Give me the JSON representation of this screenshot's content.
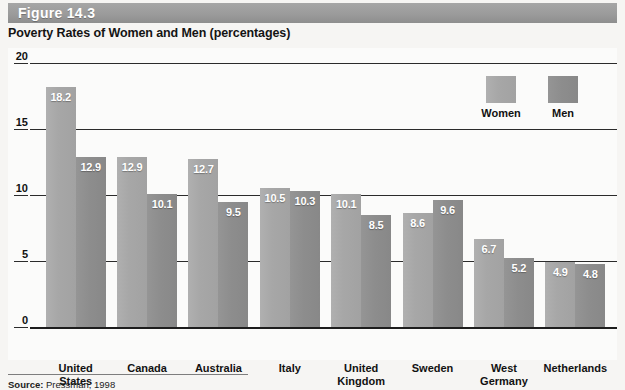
{
  "figure": {
    "label": "Figure 14.3",
    "subtitle": "Poverty Rates of Women and Men (percentages)"
  },
  "source": {
    "prefix": "Source:",
    "text": " Pressman, 1998"
  },
  "legend": {
    "items": [
      {
        "label": "Women",
        "color": "#a7a7a7"
      },
      {
        "label": "Men",
        "color": "#8d8d8d"
      }
    ]
  },
  "colors": {
    "header_band": "#9b9b9b",
    "women_bar": "#a7a7a7",
    "men_bar": "#8d8d8d",
    "gridline": "#2b2b2b",
    "plot_background": "#fbfbfa"
  },
  "chart_data": {
    "type": "bar",
    "title": "Poverty Rates of Women and Men (percentages)",
    "xlabel": "",
    "ylabel": "",
    "ylim": [
      0,
      20
    ],
    "yticks": [
      0,
      5,
      10,
      15,
      20
    ],
    "grid": true,
    "legend_position": "top-right",
    "categories": [
      "United States",
      "Canada",
      "Australia",
      "Italy",
      "United Kingdom",
      "Sweden",
      "West Germany",
      "Netherlands"
    ],
    "category_lines": [
      [
        "United",
        "States"
      ],
      [
        "Canada"
      ],
      [
        "Australia"
      ],
      [
        "Italy"
      ],
      [
        "United",
        "Kingdom"
      ],
      [
        "Sweden"
      ],
      [
        "West",
        "Germany"
      ],
      [
        "Netherlands"
      ]
    ],
    "series": [
      {
        "name": "Women",
        "color": "#a7a7a7",
        "values": [
          18.2,
          12.9,
          12.7,
          10.5,
          10.1,
          8.6,
          6.7,
          4.9
        ]
      },
      {
        "name": "Men",
        "color": "#8d8d8d",
        "values": [
          12.9,
          10.1,
          9.5,
          10.3,
          8.5,
          9.6,
          5.2,
          4.8
        ]
      }
    ]
  }
}
